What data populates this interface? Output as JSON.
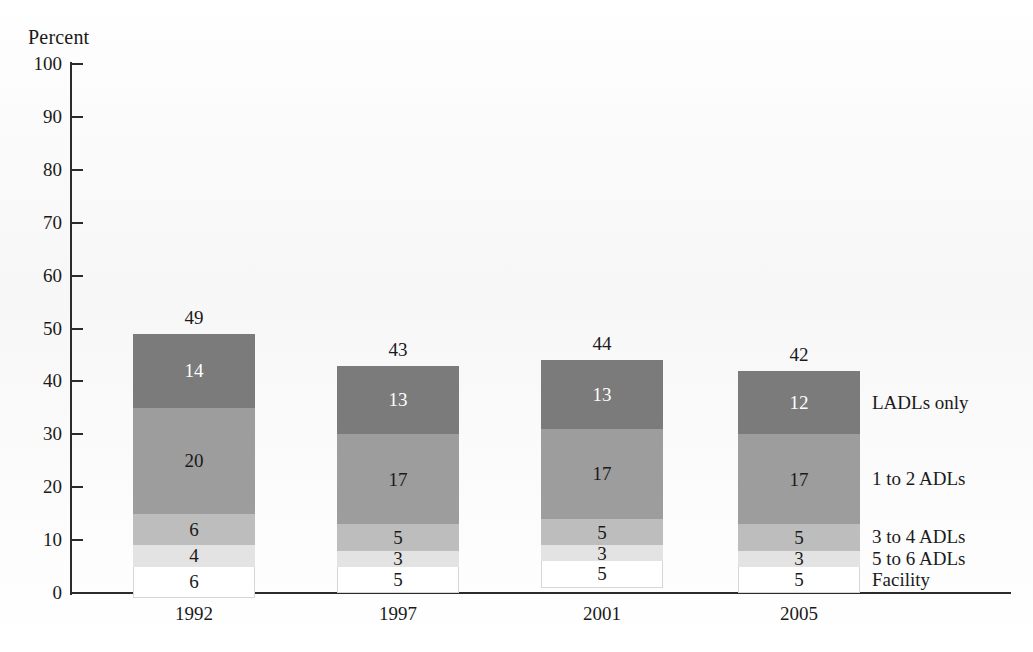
{
  "axis_title": "Percent",
  "chart_data": {
    "type": "bar",
    "subtype": "stacked-bar",
    "title": "",
    "xlabel": "",
    "ylabel": "Percent",
    "ylim": [
      0,
      100
    ],
    "yticks": [
      0,
      10,
      20,
      30,
      40,
      50,
      60,
      70,
      80,
      90,
      100
    ],
    "grid": false,
    "legend_position": "right-inline",
    "categories": [
      "1992",
      "1997",
      "2001",
      "2005"
    ],
    "totals": [
      49,
      43,
      44,
      42
    ],
    "series": [
      {
        "name": "Facility",
        "values": [
          6,
          5,
          5,
          5
        ],
        "color": "#ffffff",
        "text_color": "#1a1a1a"
      },
      {
        "name": "5 to 6 ADLs",
        "values": [
          4,
          3,
          3,
          3
        ],
        "color": "#e3e3e3",
        "text_color": "#1a1a1a"
      },
      {
        "name": "3 to 4 ADLs",
        "values": [
          6,
          5,
          5,
          5
        ],
        "color": "#bdbdbd",
        "text_color": "#1a1a1a"
      },
      {
        "name": "1 to 2 ADLs",
        "values": [
          20,
          17,
          17,
          17
        ],
        "color": "#9d9d9d",
        "text_color": "#1a1a1a"
      },
      {
        "name": "LADLs only",
        "values": [
          14,
          13,
          13,
          12
        ],
        "color": "#7b7b7b",
        "text_color": "#ffffff"
      }
    ]
  },
  "yticks": {
    "t100": "100",
    "t90": "90",
    "t80": "80",
    "t70": "70",
    "t60": "60",
    "t50": "50",
    "t40": "40",
    "t30": "30",
    "t20": "20",
    "t10": "10",
    "t0": "0"
  },
  "bars": [
    {
      "year": "1992",
      "total": "49",
      "segments": [
        {
          "label": "14",
          "series": "LADLs only"
        },
        {
          "label": "20",
          "series": "1 to 2 ADLs"
        },
        {
          "label": "6",
          "series": "3 to 4 ADLs"
        },
        {
          "label": "4",
          "series": "5 to 6 ADLs"
        },
        {
          "label": "6",
          "series": "Facility"
        }
      ]
    },
    {
      "year": "1997",
      "total": "43",
      "segments": [
        {
          "label": "13",
          "series": "LADLs only"
        },
        {
          "label": "17",
          "series": "1 to 2 ADLs"
        },
        {
          "label": "5",
          "series": "3 to 4 ADLs"
        },
        {
          "label": "3",
          "series": "5 to 6 ADLs"
        },
        {
          "label": "5",
          "series": "Facility"
        }
      ]
    },
    {
      "year": "2001",
      "total": "44",
      "segments": [
        {
          "label": "13",
          "series": "LADLs only"
        },
        {
          "label": "17",
          "series": "1 to 2 ADLs"
        },
        {
          "label": "5",
          "series": "3 to 4 ADLs"
        },
        {
          "label": "3",
          "series": "5 to 6 ADLs"
        },
        {
          "label": "5",
          "series": "Facility"
        }
      ]
    },
    {
      "year": "2005",
      "total": "42",
      "segments": [
        {
          "label": "12",
          "series": "LADLs only"
        },
        {
          "label": "17",
          "series": "1 to 2 ADLs"
        },
        {
          "label": "5",
          "series": "3 to 4 ADLs"
        },
        {
          "label": "3",
          "series": "5 to 6 ADLs"
        },
        {
          "label": "5",
          "series": "Facility"
        }
      ]
    }
  ],
  "legend": [
    {
      "label": "LADLs only",
      "color": "#7b7b7b"
    },
    {
      "label": "1 to 2 ADLs",
      "color": "#9d9d9d"
    },
    {
      "label": "3 to 4 ADLs",
      "color": "#bdbdbd"
    },
    {
      "label": "5 to 6 ADLs",
      "color": "#e3e3e3"
    },
    {
      "label": "Facility",
      "color": "#ffffff"
    }
  ]
}
